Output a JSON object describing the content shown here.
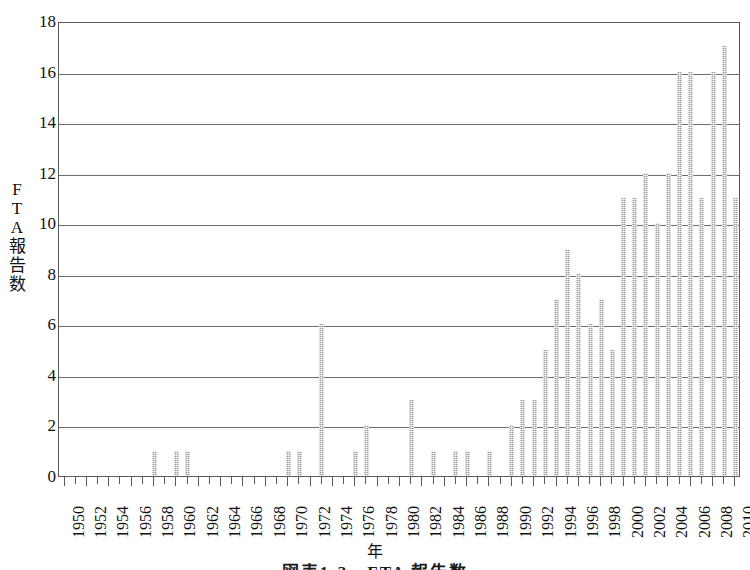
{
  "chart_data": {
    "type": "bar",
    "title": "",
    "caption": "図表1-3　FTA 報告数",
    "xlabel": "年",
    "ylabel": "FTA報告数",
    "ylabel_chars": [
      "F",
      "T",
      "A",
      "報",
      "告",
      "数"
    ],
    "ylim": [
      0,
      18
    ],
    "ytick_step": 2,
    "yticks": [
      0,
      2,
      4,
      6,
      8,
      10,
      12,
      14,
      16,
      18
    ],
    "xlim": [
      1950,
      2011
    ],
    "xtick_step": 2,
    "grid": "horizontal",
    "legend": "none",
    "bar_color": "#9a9a9a",
    "bar_pattern": "dotted-hatch",
    "axis_color": "#5a5a5a",
    "xticklabels": [
      "1950",
      "1952",
      "1954",
      "1956",
      "1958",
      "1960",
      "1962",
      "1964",
      "1966",
      "1968",
      "1970",
      "1972",
      "1974",
      "1976",
      "1978",
      "1980",
      "1982",
      "1984",
      "1986",
      "1988",
      "1990",
      "1992",
      "1994",
      "1996",
      "1998",
      "2000",
      "2002",
      "2004",
      "2006",
      "2008",
      "2010"
    ],
    "categories": [
      1950,
      1951,
      1952,
      1953,
      1954,
      1955,
      1956,
      1957,
      1958,
      1959,
      1960,
      1961,
      1962,
      1963,
      1964,
      1965,
      1966,
      1967,
      1968,
      1969,
      1970,
      1971,
      1972,
      1973,
      1974,
      1975,
      1976,
      1977,
      1978,
      1979,
      1980,
      1981,
      1982,
      1983,
      1984,
      1985,
      1986,
      1987,
      1988,
      1989,
      1990,
      1991,
      1992,
      1993,
      1994,
      1995,
      1996,
      1997,
      1998,
      1999,
      2000,
      2001,
      2002,
      2003,
      2004,
      2005,
      2006,
      2007,
      2008,
      2009,
      2010
    ],
    "values": [
      0,
      0,
      0,
      0,
      0,
      0,
      0,
      0,
      1,
      0,
      1,
      1,
      0,
      0,
      0,
      0,
      0,
      0,
      0,
      0,
      1,
      1,
      0,
      6,
      0,
      0,
      1,
      2,
      0,
      0,
      0,
      3,
      0,
      1,
      0,
      1,
      1,
      0,
      1,
      0,
      2,
      3,
      3,
      5,
      7,
      9,
      8,
      6,
      7,
      5,
      11,
      11,
      12,
      10,
      12,
      16,
      16,
      11,
      16,
      17,
      11
    ]
  }
}
